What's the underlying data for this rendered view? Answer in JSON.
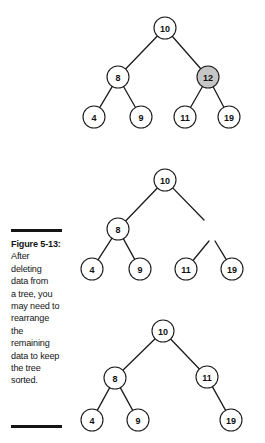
{
  "figure": {
    "caption_title": "Figure 5-13:",
    "caption_lines": [
      "After",
      "deleting",
      "data from",
      "a tree, you",
      "may need to",
      "rearrange",
      "the",
      "remaining",
      "data to keep",
      "the tree",
      "sorted."
    ]
  },
  "colors": {
    "background": "#ffffff",
    "ink": "#1b1b1b",
    "node_fill": "#ffffff",
    "node_shaded_fill": "#c6c6c6",
    "rule": "#151515"
  },
  "diagrams": [
    {
      "id": "tree-before-deletion",
      "title": "Binary search tree before deletion, node 12 highlighted",
      "nodes": [
        {
          "id": "n10",
          "label": "10",
          "cx": 165,
          "cy": 28,
          "r": 11,
          "shaded": false
        },
        {
          "id": "n8",
          "label": "8",
          "cx": 118,
          "cy": 77,
          "r": 11,
          "shaded": false
        },
        {
          "id": "n12",
          "label": "12",
          "cx": 208,
          "cy": 77,
          "r": 11,
          "shaded": true
        },
        {
          "id": "n4",
          "label": "4",
          "cx": 94,
          "cy": 117,
          "r": 11,
          "shaded": false
        },
        {
          "id": "n9",
          "label": "9",
          "cx": 141,
          "cy": 117,
          "r": 11,
          "shaded": false
        },
        {
          "id": "n11",
          "label": "11",
          "cx": 185,
          "cy": 117,
          "r": 11,
          "shaded": false
        },
        {
          "id": "n19",
          "label": "19",
          "cx": 229,
          "cy": 117,
          "r": 11,
          "shaded": false
        }
      ],
      "edges": [
        {
          "from": "n10",
          "to": "n8"
        },
        {
          "from": "n10",
          "to": "n12"
        },
        {
          "from": "n8",
          "to": "n4"
        },
        {
          "from": "n8",
          "to": "n9"
        },
        {
          "from": "n12",
          "to": "n11"
        },
        {
          "from": "n12",
          "to": "n19"
        }
      ],
      "dangling_edges": []
    },
    {
      "id": "tree-after-deletion",
      "title": "Same tree after node 12 is deleted, leaving dangling links",
      "nodes": [
        {
          "id": "n10",
          "label": "10",
          "cx": 165,
          "cy": 180,
          "r": 11,
          "shaded": false
        },
        {
          "id": "n8",
          "label": "8",
          "cx": 118,
          "cy": 229,
          "r": 11,
          "shaded": false
        },
        {
          "id": "n4",
          "label": "4",
          "cx": 92,
          "cy": 269,
          "r": 11,
          "shaded": false
        },
        {
          "id": "n9",
          "label": "9",
          "cx": 140,
          "cy": 269,
          "r": 11,
          "shaded": false
        },
        {
          "id": "n11",
          "label": "11",
          "cx": 186,
          "cy": 269,
          "r": 11,
          "shaded": false
        },
        {
          "id": "n19",
          "label": "19",
          "cx": 232,
          "cy": 269,
          "r": 11,
          "shaded": false
        }
      ],
      "edges": [
        {
          "from": "n10",
          "to": "n8"
        },
        {
          "from": "n8",
          "to": "n4"
        },
        {
          "from": "n8",
          "to": "n9"
        }
      ],
      "dangling_edges": [
        {
          "from": "n10",
          "x2": 204,
          "y2": 220
        },
        {
          "from": "n11",
          "x2": 209,
          "y2": 241
        },
        {
          "from": "n19",
          "x2": 215,
          "y2": 241
        }
      ]
    },
    {
      "id": "tree-rearranged",
      "title": "Tree rearranged so remaining data stays sorted",
      "nodes": [
        {
          "id": "n10",
          "label": "10",
          "cx": 163,
          "cy": 331,
          "r": 11,
          "shaded": false
        },
        {
          "id": "n8",
          "label": "8",
          "cx": 115,
          "cy": 378,
          "r": 11,
          "shaded": false
        },
        {
          "id": "n11",
          "label": "11",
          "cx": 207,
          "cy": 377,
          "r": 11,
          "shaded": false
        },
        {
          "id": "n4",
          "label": "4",
          "cx": 92,
          "cy": 420,
          "r": 11,
          "shaded": false
        },
        {
          "id": "n9",
          "label": "9",
          "cx": 138,
          "cy": 420,
          "r": 11,
          "shaded": false
        },
        {
          "id": "n19",
          "label": "19",
          "cx": 231,
          "cy": 420,
          "r": 11,
          "shaded": false
        }
      ],
      "edges": [
        {
          "from": "n10",
          "to": "n8"
        },
        {
          "from": "n10",
          "to": "n11"
        },
        {
          "from": "n8",
          "to": "n4"
        },
        {
          "from": "n8",
          "to": "n9"
        },
        {
          "from": "n11",
          "to": "n19"
        }
      ],
      "dangling_edges": []
    }
  ]
}
